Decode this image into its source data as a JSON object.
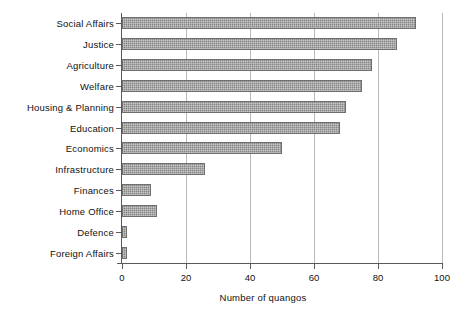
{
  "chart_data": {
    "type": "bar",
    "orientation": "horizontal",
    "title": "",
    "subtitle": "",
    "xlabel": "Number of quangos",
    "ylabel": "",
    "categories": [
      "Social Affairs",
      "Justice",
      "Agriculture",
      "Welfare",
      "Housing & Planning",
      "Education",
      "Economics",
      "Infrastructure",
      "Finances",
      "Home Office",
      "Defence",
      "Foreign Affairs"
    ],
    "values": [
      92,
      86,
      78,
      75,
      70,
      68,
      50,
      26,
      9,
      11,
      1.5,
      1.5
    ],
    "xlim": [
      0,
      100
    ],
    "xticks": [
      0,
      20,
      40,
      60,
      80,
      100
    ],
    "xtick_labels": [
      "0",
      "20",
      "40",
      "60",
      "80",
      "100"
    ],
    "grid": {
      "vertical": true,
      "horizontal": false,
      "color": "#b9b9b9"
    },
    "legend": {
      "visible": false,
      "position": "none",
      "entries": []
    },
    "colors": {
      "bar_fill": "#8e8e8e",
      "bar_edge": "#6f6f6f",
      "axis": "#5a5a5a",
      "gridline": "#b9b9b9",
      "text": "#111111",
      "background": "#ffffff"
    },
    "annotations": []
  }
}
